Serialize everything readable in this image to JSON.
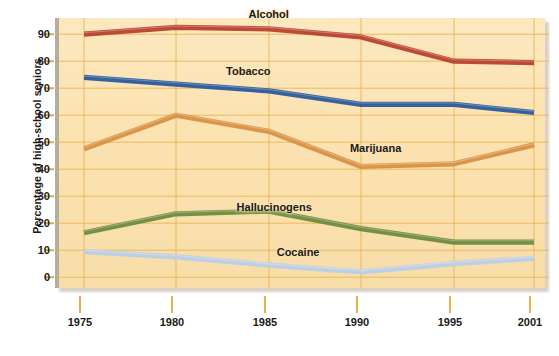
{
  "chart_data": {
    "type": "line",
    "title": "",
    "xlabel": "",
    "ylabel": "Percentage of high-school seniors",
    "x": [
      1975,
      1980,
      1985,
      1990,
      1995,
      2001
    ],
    "xtick_labels": [
      "1975",
      "1980",
      "1985",
      "1990",
      "1995",
      "2001"
    ],
    "ytick_labels": [
      "0",
      "10",
      "20",
      "30",
      "40",
      "50",
      "60",
      "70",
      "80",
      "90"
    ],
    "ytick_values": [
      0,
      10,
      20,
      30,
      40,
      50,
      60,
      70,
      80,
      90
    ],
    "ylim": [
      -4,
      96
    ],
    "xlim": [
      1974,
      2002
    ],
    "grid": true,
    "legend_position": "inline-labels",
    "series": [
      {
        "name": "Alcohol",
        "color": "#b8412f",
        "values": [
          90,
          92.5,
          92,
          89,
          80,
          79.5
        ],
        "label_x": 1985.2,
        "label_y": 97.5
      },
      {
        "name": "Tobacco",
        "color": "#2a5a9c",
        "values": [
          74,
          71.5,
          69,
          64,
          64,
          61
        ],
        "label_x": 1984.1,
        "label_y": 76.5
      },
      {
        "name": "Marijuana",
        "color": "#d89043",
        "values": [
          47.5,
          60,
          54,
          41,
          42,
          49
        ],
        "label_x": 1991.0,
        "label_y": 48.0
      },
      {
        "name": "Hallucinogens",
        "color": "#6e8b3d",
        "values": [
          16.5,
          23.5,
          24.5,
          18,
          13,
          13
        ],
        "label_x": 1985.5,
        "label_y": 26.0
      },
      {
        "name": "Cocaine",
        "color": "#b9cfe6",
        "values": [
          9.5,
          7.5,
          4.5,
          2,
          5,
          7
        ],
        "label_x": 1986.8,
        "label_y": 9.5
      }
    ],
    "colors": {
      "plot_background": "#fbe3b4",
      "gridline": "#e8b250",
      "axis_spine": "#b5ada0",
      "page_background": "#ffffff",
      "text": "#1a1a1a"
    }
  }
}
